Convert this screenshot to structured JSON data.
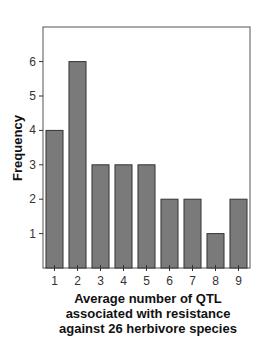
{
  "chart_data": {
    "type": "bar",
    "title": "",
    "xlabel": "Average number of QTL associated with resistance against 26 herbivore species",
    "xlabel_lines": [
      "Average number of QTL",
      "associated with resistance",
      "against 26 herbivore species"
    ],
    "ylabel": "Frequency",
    "categories": [
      "1",
      "2",
      "3",
      "4",
      "5",
      "6",
      "7",
      "8",
      "9"
    ],
    "values": [
      4,
      6,
      3,
      3,
      3,
      2,
      2,
      1,
      2
    ],
    "yticks": [
      1,
      2,
      3,
      4,
      5,
      6
    ],
    "ylim": [
      0,
      7
    ],
    "grid": false,
    "legend": null,
    "bar_color": "#7a7a7a",
    "bar_edge_color": "#333333"
  }
}
